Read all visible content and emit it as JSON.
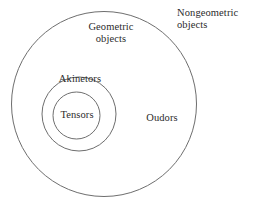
{
  "diagram": {
    "type": "nested-set-diagram",
    "background_color": "#ffffff",
    "stroke_color": "#6e6e6e",
    "text_color": "#2b2b2b",
    "labels": {
      "geometric": "Geometric\nobjects",
      "nongeometric": "Nongeometric\nobjects",
      "oudors": "Oudors",
      "akinetors": "Akinetors",
      "tensors": "Tensors"
    },
    "circles": [
      {
        "name": "geometric-objects-circle",
        "label": "Geometric objects",
        "cx": 104,
        "cy": 104,
        "r": 92.5,
        "stroke": "#6e6e6e",
        "stroke_width": 1,
        "fill": "none"
      },
      {
        "name": "akinetors-circle",
        "label": "Akinetors",
        "cx": 79,
        "cy": 114,
        "r": 37,
        "stroke": "#6e6e6e",
        "stroke_width": 1,
        "fill": "none"
      },
      {
        "name": "tensors-circle",
        "label": "Tensors",
        "cx": 76.5,
        "cy": 115.5,
        "r": 23.5,
        "stroke": "#6e6e6e",
        "stroke_width": 1,
        "fill": "none"
      }
    ]
  }
}
